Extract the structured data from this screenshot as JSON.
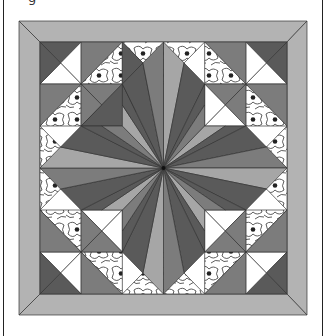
{
  "caption_fragment": "g",
  "quilt": {
    "outer": {
      "x": 19,
      "y": 21,
      "w": 288,
      "h": 294
    },
    "inner": {
      "x": 40,
      "y": 42,
      "w": 247,
      "h": 252
    },
    "grid": 6,
    "colors": {
      "border": "#b3b3b3",
      "dark": "#5a5a5a",
      "mid": "#7c7c7c",
      "light": "#a6a6a6",
      "white": "#ffffff",
      "floral_bg": "#ffffff",
      "floral_line": "#333333",
      "seam": "#333333"
    }
  }
}
